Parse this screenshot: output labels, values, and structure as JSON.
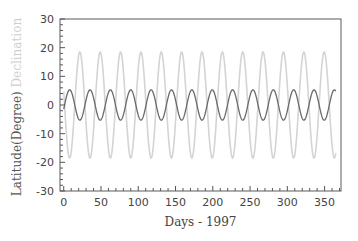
{
  "chart_data": {
    "type": "line",
    "title": "",
    "xlabel": "Days - 1997",
    "ylabel_parts": [
      {
        "text": "Latitude(Degree)",
        "color": "#555555"
      },
      {
        "text": " Declination",
        "color": "#cfcfcf"
      }
    ],
    "xlim": [
      -5,
      372
    ],
    "ylim": [
      -30,
      30
    ],
    "xticks": [
      0,
      50,
      100,
      150,
      200,
      250,
      300,
      350
    ],
    "yticks": [
      30,
      20,
      10,
      0,
      -10,
      -20,
      -30
    ],
    "x_minor_step": 10,
    "y_minor_step": 2,
    "grid": false,
    "legend": "none (series identified by colored y-axis label)",
    "x": [
      0,
      5,
      10,
      15,
      20,
      25,
      30,
      35,
      40,
      45,
      50,
      55,
      60,
      65,
      70,
      75,
      80,
      85,
      90,
      95,
      100,
      105,
      110,
      115,
      120,
      125,
      130,
      135,
      140,
      145,
      150,
      155,
      160,
      165,
      170,
      175,
      180,
      185,
      190,
      195,
      200,
      205,
      210,
      215,
      220,
      225,
      230,
      235,
      240,
      245,
      250,
      255,
      260,
      265,
      270,
      275,
      280,
      285,
      290,
      295,
      300,
      305,
      310,
      315,
      320,
      325,
      330,
      335,
      340,
      345,
      350,
      355,
      360,
      365
    ],
    "series": [
      {
        "name": "Declination",
        "color": "#d4d4d4",
        "model": {
          "amplitude": 18.5,
          "period_days": 27.32,
          "peak_day": 21.6
        },
        "values": [
          4.7,
          -14.4,
          -16.4,
          1.0,
          17.3,
          13.1,
          -6.5,
          -18.5,
          -8.6,
          11.5,
          17.9,
          3.3,
          -15.3,
          -16.3,
          2.2,
          17.9,
          11.9,
          -7.8,
          -18.5,
          -7.2,
          12.4,
          17.6,
          2.0,
          -16.4,
          -15.3,
          3.7,
          18.3,
          10.9,
          -9.1,
          -18.4,
          -5.8,
          13.4,
          17.2,
          0.5,
          -17.2,
          -14.2,
          5.3,
          18.5,
          9.6,
          -10.5,
          -18.1,
          -4.3,
          14.5,
          16.6,
          -1.2,
          -17.8,
          -12.9,
          6.8,
          18.4,
          8.1,
          -11.7,
          -17.7,
          -2.8,
          15.4,
          15.8,
          -2.8,
          -18.2,
          -11.5,
          8.2,
          18.5,
          6.5,
          -13.0,
          -17.3,
          -1.3,
          16.2,
          14.9,
          -4.3,
          -18.4,
          -10.1,
          9.8,
          18.3,
          5.0,
          -13.9,
          -17.0
        ]
      },
      {
        "name": "Latitude",
        "color": "#6a6a6a",
        "model": {
          "amplitude": 5.3,
          "period_days": 27.32,
          "peak_day": 8.0
        },
        "values": [
          -1.4,
          4.1,
          4.7,
          -0.2,
          -4.9,
          -3.8,
          1.8,
          5.3,
          2.5,
          -3.2,
          -5.2,
          -1.0,
          4.4,
          4.6,
          -0.6,
          -5.1,
          -3.5,
          2.2,
          5.3,
          2.0,
          -3.6,
          -5.0,
          -0.5,
          4.7,
          4.4,
          -1.1,
          -5.2,
          -3.1,
          2.6,
          5.3,
          1.6,
          -3.9,
          -4.9,
          -0.1,
          4.9,
          4.0,
          -1.5,
          -5.3,
          -2.7,
          3.0,
          5.2,
          1.2,
          -4.2,
          -4.7,
          0.4,
          5.1,
          3.7,
          -2.0,
          -5.3,
          -2.3,
          3.4,
          5.1,
          0.8,
          -4.4,
          -4.5,
          0.8,
          5.2,
          3.2,
          -2.4,
          -5.3,
          -1.8,
          3.7,
          4.9,
          0.3,
          -4.7,
          -4.2,
          1.3,
          5.3,
          2.9,
          -2.8,
          -5.2,
          -1.4,
          4.0,
          4.9
        ]
      }
    ]
  },
  "layout": {
    "plot": {
      "left": 60,
      "top": 19,
      "right": 341,
      "bottom": 191
    },
    "axis_color": "#555555",
    "label_color": "#444444"
  }
}
